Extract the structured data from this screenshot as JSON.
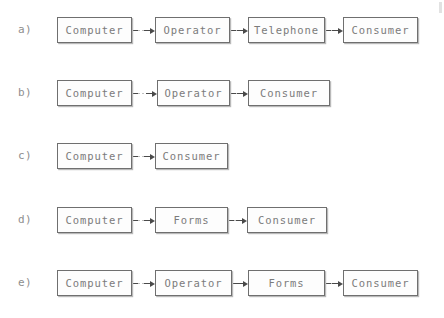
{
  "figure": {
    "background_color": "#ffffff",
    "box_border_color": "#6f6f6f",
    "text_color": "#7b7b7b",
    "label_color": "#8e8e8e",
    "connector_color": "#4a4a4a"
  },
  "rows": [
    {
      "label": "a)",
      "top": 17,
      "nodes": [
        {
          "text": "Computer",
          "left": 57,
          "width": 75
        },
        {
          "text": "Operator",
          "left": 155,
          "width": 75
        },
        {
          "text": "Telephone",
          "left": 248,
          "width": 77
        },
        {
          "text": "Consumer",
          "left": 343,
          "width": 75
        }
      ],
      "links": [
        {
          "left": 132,
          "width": 23
        },
        {
          "left": 230,
          "width": 18
        },
        {
          "left": 325,
          "width": 18
        }
      ]
    },
    {
      "label": "b)",
      "top": 80,
      "nodes": [
        {
          "text": "Computer",
          "left": 57,
          "width": 75
        },
        {
          "text": "Operator",
          "left": 157,
          "width": 73
        },
        {
          "text": "Consumer",
          "left": 248,
          "width": 82
        }
      ],
      "links": [
        {
          "left": 132,
          "width": 25
        },
        {
          "left": 230,
          "width": 18
        }
      ]
    },
    {
      "label": "c)",
      "top": 143,
      "nodes": [
        {
          "text": "Computer",
          "left": 57,
          "width": 75
        },
        {
          "text": "Consumer",
          "left": 155,
          "width": 73
        }
      ],
      "links": [
        {
          "left": 132,
          "width": 23
        }
      ]
    },
    {
      "label": "d)",
      "top": 207,
      "nodes": [
        {
          "text": "Computer",
          "left": 57,
          "width": 75
        },
        {
          "text": "Forms",
          "left": 155,
          "width": 73
        },
        {
          "text": "Consumer",
          "left": 247,
          "width": 80
        }
      ],
      "links": [
        {
          "left": 132,
          "width": 23
        },
        {
          "left": 228,
          "width": 19
        }
      ]
    },
    {
      "label": "e)",
      "top": 270,
      "nodes": [
        {
          "text": "Computer",
          "left": 57,
          "width": 75
        },
        {
          "text": "Operator",
          "left": 155,
          "width": 77
        },
        {
          "text": "Forms",
          "left": 248,
          "width": 77
        },
        {
          "text": "Consumer",
          "left": 343,
          "width": 75
        }
      ],
      "links": [
        {
          "left": 132,
          "width": 23
        },
        {
          "left": 232,
          "width": 16
        },
        {
          "left": 325,
          "width": 18
        }
      ]
    }
  ]
}
